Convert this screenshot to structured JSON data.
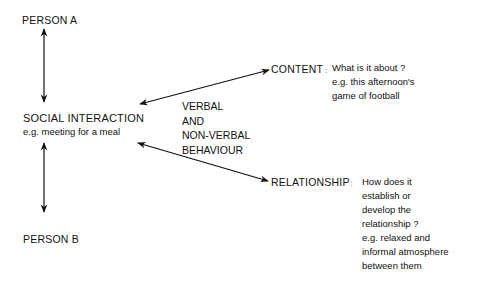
{
  "diagram": {
    "person_a": "PERSON A",
    "person_b": "PERSON B",
    "social_interaction": {
      "title": "SOCIAL INTERACTION",
      "example": "e.g. meeting for a meal"
    },
    "channel": [
      "VERBAL",
      "AND",
      "NON-VERBAL",
      "BEHAVIOUR"
    ],
    "content": {
      "label": "CONTENT",
      "separator": ":",
      "lines": [
        "What is it about ?",
        "e.g. this afternoon's",
        "game of football"
      ]
    },
    "relationship": {
      "label": "RELATIONSHIP",
      "separator": ":",
      "lines": [
        "How does it",
        "establish or",
        "develop the",
        "relationship ?",
        "e.g. relaxed and",
        "informal atmosphere",
        "between them"
      ]
    },
    "colors": {
      "ink": "#111111",
      "background": "#ffffff"
    }
  }
}
